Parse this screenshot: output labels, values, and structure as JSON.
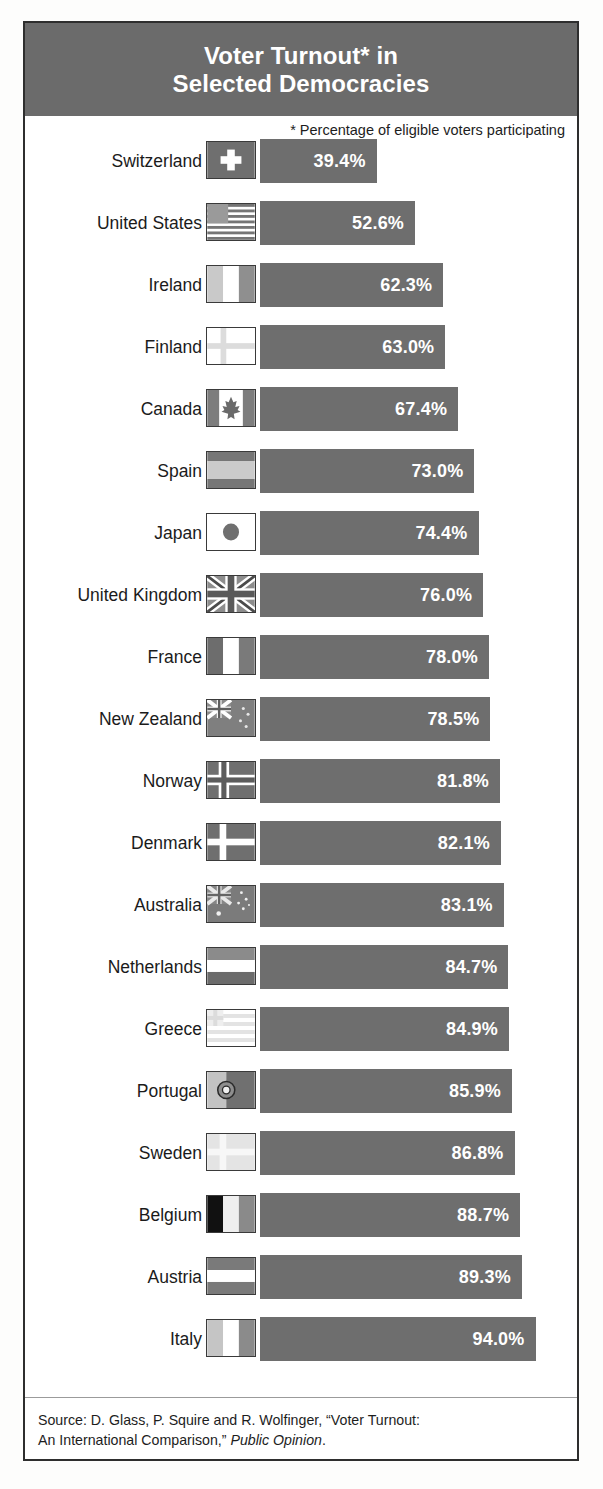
{
  "title": {
    "line1": "Voter Turnout* in",
    "line2": "Selected Democracies",
    "full": "Voter Turnout* in\nSelected Democracies"
  },
  "footnote": "* Percentage of eligible voters participating",
  "source": {
    "line1": "Source: D. Glass, P. Squire and R. Wolfinger, “Voter Turnout:",
    "line2_prefix": "An International Comparison,” ",
    "line2_italic": "Public Opinion",
    "line2_suffix": "."
  },
  "colors": {
    "bar": "#6e6e6e",
    "title_band": "#6b6b6b",
    "title_text": "#ffffff",
    "value_text": "#ffffff",
    "label_text": "#1b1b1b",
    "frame": "#2e2e2e"
  },
  "chart_data": {
    "type": "bar",
    "orientation": "horizontal",
    "title": "Voter Turnout* in Selected Democracies",
    "subtitle": "* Percentage of eligible voters participating",
    "xlabel": "",
    "ylabel": "",
    "unit": "%",
    "xlim": [
      0,
      100
    ],
    "grid": false,
    "legend": false,
    "sorted": "ascending",
    "categories": [
      "Switzerland",
      "United States",
      "Ireland",
      "Finland",
      "Canada",
      "Spain",
      "Japan",
      "United Kingdom",
      "France",
      "New Zealand",
      "Norway",
      "Denmark",
      "Australia",
      "Netherlands",
      "Greece",
      "Portugal",
      "Sweden",
      "Belgium",
      "Austria",
      "Italy"
    ],
    "values": [
      39.4,
      52.6,
      62.3,
      63.0,
      67.4,
      73.0,
      74.4,
      76.0,
      78.0,
      78.5,
      81.8,
      82.1,
      83.1,
      84.7,
      84.9,
      85.9,
      86.8,
      88.7,
      89.3,
      94.0
    ],
    "labels": [
      "39.4%",
      "52.6%",
      "62.3%",
      "63.0%",
      "67.4%",
      "73.0%",
      "74.4%",
      "76.0%",
      "78.0%",
      "78.5%",
      "81.8%",
      "82.1%",
      "83.1%",
      "84.7%",
      "84.9%",
      "85.9%",
      "86.8%",
      "88.7%",
      "89.3%",
      "94.0%"
    ]
  },
  "rows": [
    {
      "country": "Switzerland",
      "value": 39.4,
      "label": "39.4%",
      "flag": "flag-switzerland"
    },
    {
      "country": "United States",
      "value": 52.6,
      "label": "52.6%",
      "flag": "flag-united-states"
    },
    {
      "country": "Ireland",
      "value": 62.3,
      "label": "62.3%",
      "flag": "flag-ireland"
    },
    {
      "country": "Finland",
      "value": 63.0,
      "label": "63.0%",
      "flag": "flag-finland"
    },
    {
      "country": "Canada",
      "value": 67.4,
      "label": "67.4%",
      "flag": "flag-canada"
    },
    {
      "country": "Spain",
      "value": 73.0,
      "label": "73.0%",
      "flag": "flag-spain"
    },
    {
      "country": "Japan",
      "value": 74.4,
      "label": "74.4%",
      "flag": "flag-japan"
    },
    {
      "country": "United Kingdom",
      "value": 76.0,
      "label": "76.0%",
      "flag": "flag-united-kingdom"
    },
    {
      "country": "France",
      "value": 78.0,
      "label": "78.0%",
      "flag": "flag-france"
    },
    {
      "country": "New Zealand",
      "value": 78.5,
      "label": "78.5%",
      "flag": "flag-new-zealand"
    },
    {
      "country": "Norway",
      "value": 81.8,
      "label": "81.8%",
      "flag": "flag-norway"
    },
    {
      "country": "Denmark",
      "value": 82.1,
      "label": "82.1%",
      "flag": "flag-denmark"
    },
    {
      "country": "Australia",
      "value": 83.1,
      "label": "83.1%",
      "flag": "flag-australia"
    },
    {
      "country": "Netherlands",
      "value": 84.7,
      "label": "84.7%",
      "flag": "flag-netherlands"
    },
    {
      "country": "Greece",
      "value": 84.9,
      "label": "84.9%",
      "flag": "flag-greece"
    },
    {
      "country": "Portugal",
      "value": 85.9,
      "label": "85.9%",
      "flag": "flag-portugal"
    },
    {
      "country": "Sweden",
      "value": 86.8,
      "label": "86.8%",
      "flag": "flag-sweden"
    },
    {
      "country": "Belgium",
      "value": 88.7,
      "label": "88.7%",
      "flag": "flag-belgium"
    },
    {
      "country": "Austria",
      "value": 89.3,
      "label": "89.3%",
      "flag": "flag-austria"
    },
    {
      "country": "Italy",
      "value": 94.0,
      "label": "94.0%",
      "flag": "flag-italy"
    }
  ]
}
